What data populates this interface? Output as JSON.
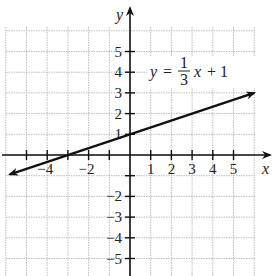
{
  "chart_data": {
    "type": "line",
    "title": "",
    "xlabel": "x",
    "ylabel": "y",
    "xlim": [
      -6,
      6
    ],
    "ylim": [
      -6,
      6
    ],
    "grid": true,
    "x_ticks": [
      -5,
      -4,
      -3,
      -2,
      -1,
      1,
      2,
      3,
      4,
      5
    ],
    "x_tick_labels": [
      "-4",
      "-2",
      "1",
      "2",
      "3",
      "4",
      "5"
    ],
    "y_ticks": [
      -5,
      -4,
      -3,
      -2,
      -1,
      1,
      2,
      3,
      4,
      5
    ],
    "y_tick_labels": [
      "5",
      "4",
      "3",
      "2",
      "1",
      "-2",
      "-3",
      "-4",
      "-5"
    ],
    "series": [
      {
        "name": "y = (1/3)x + 1",
        "equation": "y = 1/3 x + 1",
        "slope": 0.3333,
        "intercept": 1,
        "x": [
          -6,
          6
        ],
        "y": [
          -1,
          3
        ],
        "arrows": "both"
      }
    ],
    "annotations": [
      {
        "text": "y = 1/3 x + 1",
        "x": 1.5,
        "y": 4
      }
    ]
  },
  "labels": {
    "x_axis": "x",
    "y_axis": "y",
    "eq_y": "y",
    "eq_equals": "=",
    "eq_num": "1",
    "eq_den": "3",
    "eq_x": "x",
    "eq_plus": "+ 1"
  }
}
